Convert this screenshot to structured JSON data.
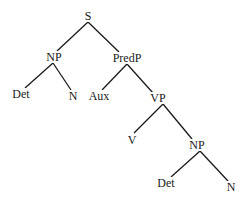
{
  "diagram": {
    "type": "syntax-tree",
    "nodes": [
      {
        "id": "S",
        "label": "S",
        "x": 88,
        "y": 16
      },
      {
        "id": "NP1",
        "label": "NP",
        "x": 54,
        "y": 57
      },
      {
        "id": "PredP",
        "label": "PredP",
        "x": 127,
        "y": 58
      },
      {
        "id": "Det1",
        "label": "Det",
        "x": 21,
        "y": 94
      },
      {
        "id": "N1",
        "label": "N",
        "x": 73,
        "y": 96
      },
      {
        "id": "Aux",
        "label": "Aux",
        "x": 99,
        "y": 96
      },
      {
        "id": "VP",
        "label": "VP",
        "x": 158,
        "y": 98
      },
      {
        "id": "V",
        "label": "V",
        "x": 132,
        "y": 140
      },
      {
        "id": "NP2",
        "label": "NP",
        "x": 197,
        "y": 145
      },
      {
        "id": "Det2",
        "label": "Det",
        "x": 166,
        "y": 183
      },
      {
        "id": "N2",
        "label": "N",
        "x": 231,
        "y": 187
      }
    ],
    "edges": [
      {
        "from": "S",
        "to": "NP1",
        "x1": 88,
        "y1": 22,
        "x2": 57,
        "y2": 51
      },
      {
        "from": "S",
        "to": "PredP",
        "x1": 88,
        "y1": 22,
        "x2": 119,
        "y2": 52
      },
      {
        "from": "NP1",
        "to": "Det1",
        "x1": 53,
        "y1": 63,
        "x2": 25,
        "y2": 88
      },
      {
        "from": "NP1",
        "to": "N1",
        "x1": 53,
        "y1": 63,
        "x2": 71,
        "y2": 90
      },
      {
        "from": "PredP",
        "to": "Aux",
        "x1": 127,
        "y1": 64,
        "x2": 102,
        "y2": 90
      },
      {
        "from": "PredP",
        "to": "VP",
        "x1": 127,
        "y1": 64,
        "x2": 153,
        "y2": 93
      },
      {
        "from": "VP",
        "to": "V",
        "x1": 163,
        "y1": 104,
        "x2": 134,
        "y2": 133
      },
      {
        "from": "VP",
        "to": "NP2",
        "x1": 163,
        "y1": 104,
        "x2": 192,
        "y2": 139
      },
      {
        "from": "NP2",
        "to": "Det2",
        "x1": 200,
        "y1": 151,
        "x2": 171,
        "y2": 177
      },
      {
        "from": "NP2",
        "to": "N2",
        "x1": 200,
        "y1": 151,
        "x2": 228,
        "y2": 181
      }
    ],
    "colors": {
      "line": "#1a1a1a",
      "text": "#1a1a1a",
      "background": "#ffffff"
    }
  }
}
